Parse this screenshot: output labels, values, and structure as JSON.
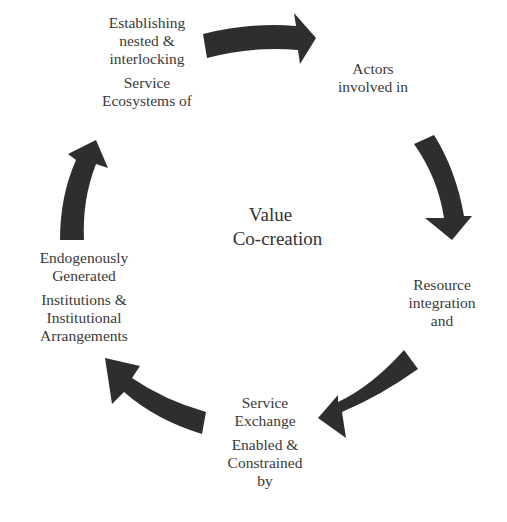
{
  "diagram": {
    "type": "cycle",
    "center": {
      "lines": [
        "Value",
        "Co-creation"
      ]
    },
    "nodes": [
      {
        "id": "actors",
        "lines": [
          "Actors",
          "involved in"
        ]
      },
      {
        "id": "resource",
        "lines": [
          "Resource",
          "integration",
          "and"
        ]
      },
      {
        "id": "service-exchange",
        "lines_a": [
          "Service",
          "Exchange"
        ],
        "lines_b": [
          "Enabled &",
          "Constrained",
          "by"
        ]
      },
      {
        "id": "institutions",
        "lines_a": [
          "Endogenously",
          "Generated"
        ],
        "lines_b": [
          "Institutions &",
          "Institutional",
          "Arrangements"
        ]
      },
      {
        "id": "ecosystems",
        "lines_a": [
          "Establishing",
          "nested &",
          "interlocking"
        ],
        "lines_b": [
          "Service",
          "Ecosystems of"
        ]
      }
    ],
    "arrow_color": "#2e2e2e",
    "text_color": "#3a3a3a",
    "flow": "clockwise"
  }
}
